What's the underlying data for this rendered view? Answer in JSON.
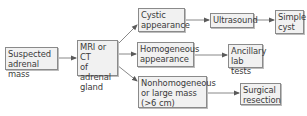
{
  "diagram": {
    "type": "flowchart",
    "colors": {
      "box_fill": "#f1f1f1",
      "box_border": "#8a8a8a",
      "text": "#3a3a3a",
      "arrow": "#6a6a6a"
    },
    "nodes": {
      "suspected": {
        "label": "Suspected\nadrenal mass"
      },
      "imaging": {
        "label": "MRI or CT\nof adrenal\ngland"
      },
      "cystic": {
        "label": "Cystic\nappearance"
      },
      "ultrasound": {
        "label": "Ultrasound"
      },
      "simple_cyst": {
        "label": "Simple\ncyst"
      },
      "homogeneous": {
        "label": "Homogeneous\nappearance"
      },
      "ancillary": {
        "label": "Ancillary\nlab tests"
      },
      "nonhomogeneous": {
        "label": "Nonhomogeneous\nor large mass\n(>6 cm)"
      },
      "surgical": {
        "label": "Surgical\nresection"
      }
    },
    "edges": [
      {
        "from": "suspected",
        "to": "imaging"
      },
      {
        "from": "imaging",
        "to": "cystic"
      },
      {
        "from": "imaging",
        "to": "homogeneous"
      },
      {
        "from": "imaging",
        "to": "nonhomogeneous"
      },
      {
        "from": "cystic",
        "to": "ultrasound"
      },
      {
        "from": "ultrasound",
        "to": "simple_cyst"
      },
      {
        "from": "homogeneous",
        "to": "ancillary"
      },
      {
        "from": "nonhomogeneous",
        "to": "surgical"
      }
    ]
  }
}
